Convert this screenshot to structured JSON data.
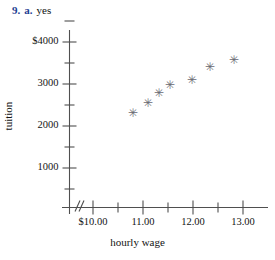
{
  "heading": {
    "number": "9.",
    "part": "a.",
    "answer": "yes"
  },
  "chart_data": {
    "type": "scatter",
    "title": "",
    "xlabel": "hourly wage",
    "ylabel": "tuition",
    "xlim": [
      9.75,
      13.3
    ],
    "ylim": [
      0,
      4250
    ],
    "grid": false,
    "legend": null,
    "axis_break_x": true,
    "axis_break_y": false,
    "x_ticks_major": [
      "$10.00",
      "11.00",
      "12.00",
      "13.00"
    ],
    "x_tick_values_major": [
      10.0,
      11.0,
      12.0,
      13.0
    ],
    "x_tick_values_minor": [
      10.5,
      11.5,
      12.5
    ],
    "y_ticks_major": [
      "$4000",
      "3000",
      "2000",
      "1000"
    ],
    "y_tick_values_major": [
      4000,
      3000,
      2000,
      1000
    ],
    "y_tick_values_minor": [
      3500,
      2500,
      1500,
      500
    ],
    "marker": "asterisk",
    "points": [
      {
        "x": 10.79,
        "y": 2300
      },
      {
        "x": 11.09,
        "y": 2540
      },
      {
        "x": 11.32,
        "y": 2780
      },
      {
        "x": 11.53,
        "y": 2980
      },
      {
        "x": 11.97,
        "y": 3100
      },
      {
        "x": 12.33,
        "y": 3400
      },
      {
        "x": 12.81,
        "y": 3570
      }
    ]
  },
  "marker_glyph": "✳"
}
